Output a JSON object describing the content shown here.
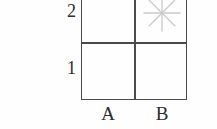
{
  "figure": {
    "kind": "two-by-two-grid-diagram",
    "grid": {
      "columns": [
        "A",
        "B"
      ],
      "rows": [
        "2",
        "1"
      ],
      "row_order_top_to_bottom": [
        "2",
        "1"
      ],
      "line_color": "#4a4a4a",
      "background_color": "#ffffff",
      "cells": [
        {
          "id": "A2",
          "column": "A",
          "row": "2",
          "content": ""
        },
        {
          "id": "B2",
          "column": "B",
          "row": "2",
          "content": "asterisk-marker"
        },
        {
          "id": "A1",
          "column": "A",
          "row": "1",
          "content": ""
        },
        {
          "id": "B1",
          "column": "B",
          "row": "1",
          "content": ""
        }
      ]
    },
    "marker": {
      "name": "asterisk-marker",
      "glyph": "8-ray-starburst",
      "cell": "B2",
      "color": "#c9c9c9",
      "rays": 8
    },
    "labels": {
      "column_a": "A",
      "column_b": "B",
      "row_2": "2",
      "row_1": "1"
    }
  }
}
